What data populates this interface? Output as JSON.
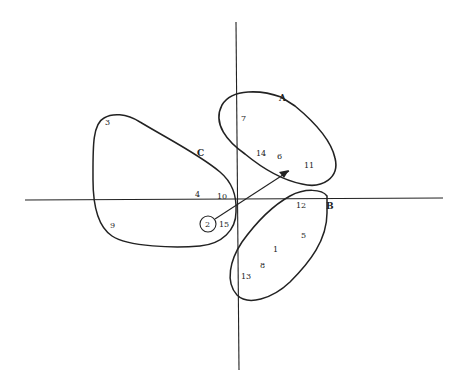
{
  "diagram": {
    "type": "cluster plot with axes",
    "axes": {
      "horizontal": true,
      "vertical": true
    },
    "clusters": [
      {
        "label": "A",
        "members": [
          "7",
          "14",
          "6",
          "11"
        ]
      },
      {
        "label": "B",
        "members": [
          "12",
          "5",
          "1",
          "8",
          "13"
        ]
      },
      {
        "label": "C",
        "members": [
          "3",
          "4",
          "10",
          "9",
          "15"
        ]
      }
    ],
    "isolated_point": {
      "label": "2",
      "circled": true
    },
    "arrow": {
      "from": "2",
      "toward": "A"
    },
    "points": {
      "p1": "1",
      "p2": "2",
      "p3": "3",
      "p4": "4",
      "p5": "5",
      "p6": "6",
      "p7": "7",
      "p8": "8",
      "p9": "9",
      "p10": "10",
      "p11": "11",
      "p12": "12",
      "p13": "13",
      "p14": "14",
      "p15": "15"
    },
    "labels": {
      "A": "A",
      "B": "B",
      "C": "C"
    }
  }
}
